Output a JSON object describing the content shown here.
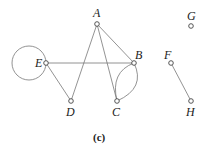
{
  "diagram": {
    "type": "graph",
    "caption": "(c)",
    "nodes": [
      {
        "id": "A",
        "label": "A"
      },
      {
        "id": "B",
        "label": "B"
      },
      {
        "id": "C",
        "label": "C"
      },
      {
        "id": "D",
        "label": "D"
      },
      {
        "id": "E",
        "label": "E"
      },
      {
        "id": "F",
        "label": "F"
      },
      {
        "id": "G",
        "label": "G"
      },
      {
        "id": "H",
        "label": "H"
      }
    ],
    "edges": [
      {
        "from": "E",
        "to": "E",
        "kind": "loop"
      },
      {
        "from": "E",
        "to": "B"
      },
      {
        "from": "E",
        "to": "D"
      },
      {
        "from": "D",
        "to": "A"
      },
      {
        "from": "A",
        "to": "C"
      },
      {
        "from": "A",
        "to": "B"
      },
      {
        "from": "B",
        "to": "C",
        "kind": "curved"
      },
      {
        "from": "B",
        "to": "C",
        "kind": "curved"
      },
      {
        "from": "F",
        "to": "H"
      }
    ]
  }
}
